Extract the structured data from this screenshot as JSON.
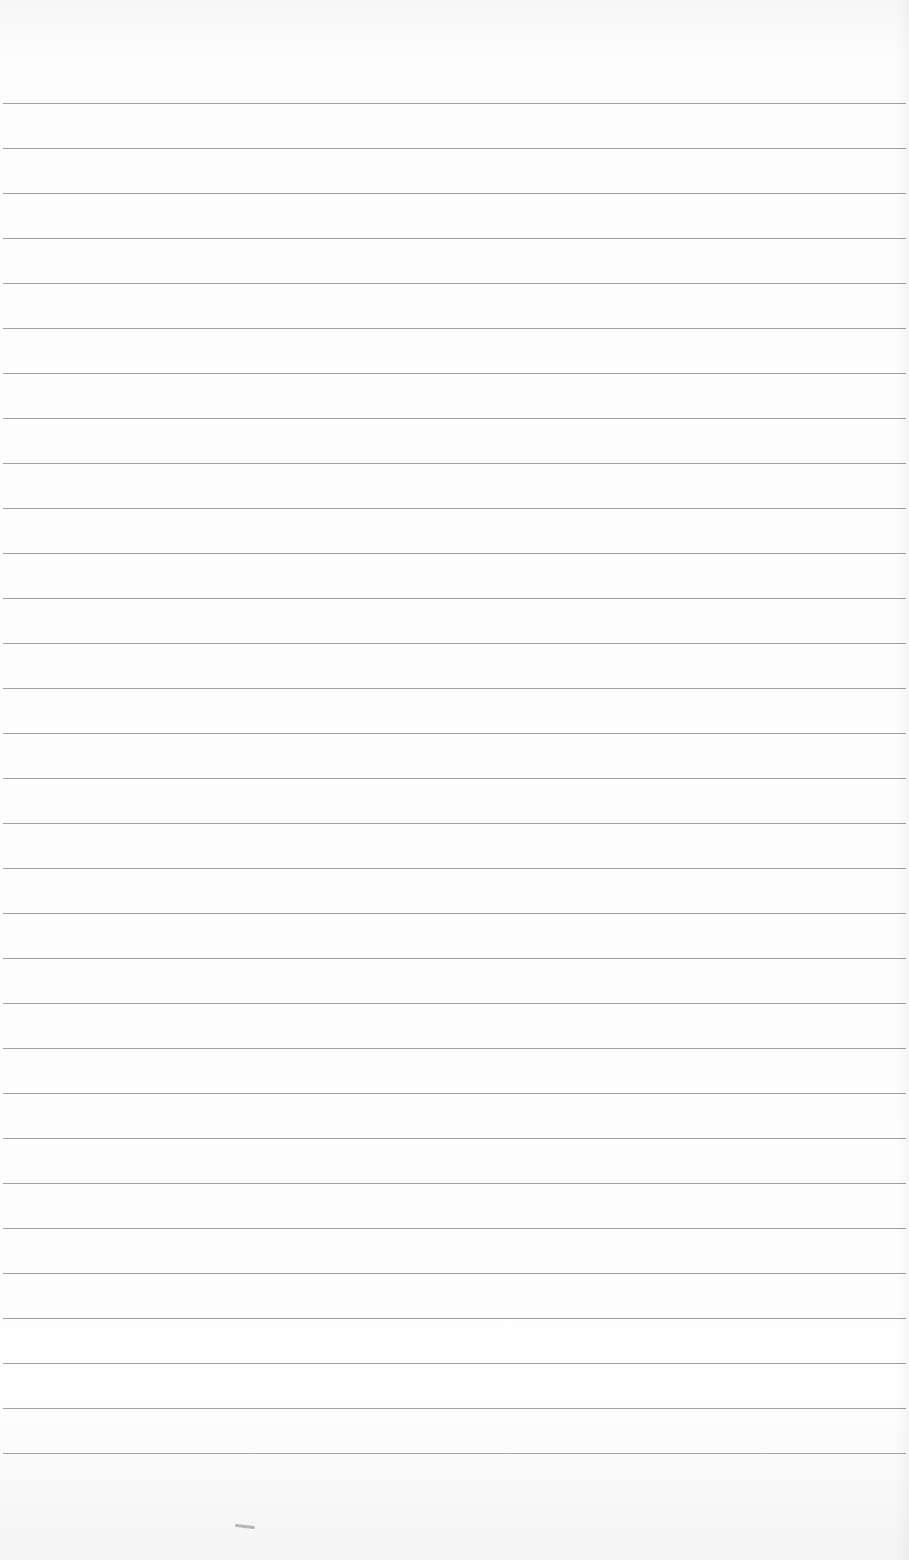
{
  "page": {
    "type": "lined-paper",
    "background_color": "#fcfcfc",
    "rule_color": "#8f8f8f",
    "rule_count": 31,
    "first_rule_y": 103,
    "rule_spacing": 45,
    "text_content": ""
  }
}
